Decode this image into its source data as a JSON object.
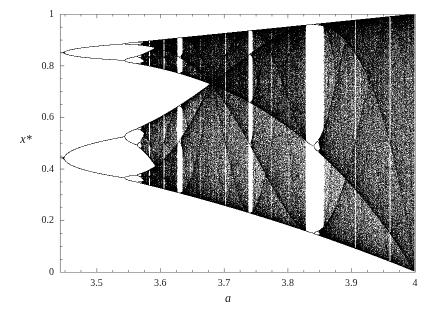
{
  "figure": {
    "title": "",
    "background_color": "#ffffff",
    "ink_color": "#000000",
    "frame_color": "#555555"
  },
  "axes": {
    "xlabel": "a",
    "ylabel": "x*",
    "xticks": [
      "3.5",
      "3.6",
      "3.7",
      "3.8",
      "3.9",
      "4"
    ],
    "xtick_values": [
      3.5,
      3.6,
      3.7,
      3.8,
      3.9,
      4.0
    ],
    "yticks": [
      "0",
      "0.2",
      "0.4",
      "0.6",
      "0.8",
      "1"
    ],
    "ytick_values": [
      0,
      0.2,
      0.4,
      0.6,
      0.8,
      1.0
    ],
    "xlim": [
      3.4425,
      4.0
    ],
    "ylim": [
      0,
      1
    ],
    "grid": false,
    "frame": true
  },
  "chart_data": {
    "type": "scatter",
    "title": "",
    "xlabel": "a",
    "ylabel": "x*",
    "xlim": [
      3.4425,
      4.0
    ],
    "ylim": [
      0,
      1
    ],
    "grid": false,
    "legend": "none",
    "map": {
      "name": "logistic",
      "equation": "x_{n+1} = a x_n (1 - x_n)",
      "x0": 0.35,
      "transient_iterations": 360,
      "plot_iterations": 420,
      "a_samples": 1700
    },
    "annotations": [
      {
        "label": "period-2 branches at left edge",
        "a": 3.4425,
        "x_values": [
          0.432,
          0.848
        ]
      },
      {
        "label": "period-4 onset",
        "a": 3.449,
        "x_values": [
          0.38,
          0.5,
          0.83,
          0.88
        ]
      },
      {
        "label": "period-8 onset",
        "a": 3.544
      },
      {
        "label": "accumulation (Feigenbaum) point",
        "a": 3.5699
      },
      {
        "label": "period-6 window",
        "a": 3.627
      },
      {
        "label": "band merging to single chaotic band",
        "a": 3.6786
      },
      {
        "label": "period-5 window",
        "a": 3.7382
      },
      {
        "label": "period-3 window",
        "a": 3.8284,
        "a_end": 3.857
      },
      {
        "label": "period-4 window",
        "a": 3.9601
      },
      {
        "label": "full chaos, attractor fills unit interval",
        "a": 4.0,
        "x_values": [
          0.0,
          1.0
        ]
      }
    ]
  },
  "plot_geometry": {
    "left": 60,
    "right": 415,
    "top": 14,
    "bottom": 272
  }
}
